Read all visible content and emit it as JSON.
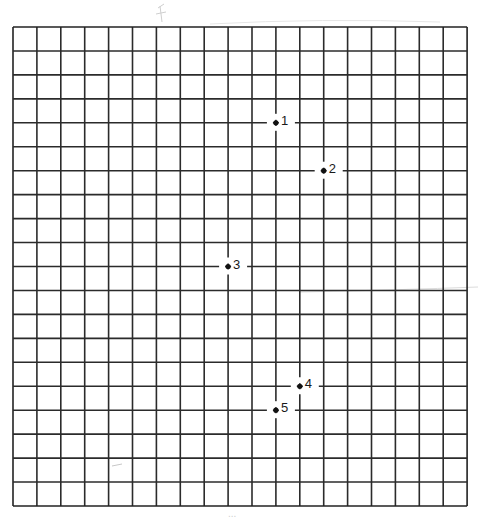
{
  "figure": {
    "type": "grid-with-labeled-points",
    "grid": {
      "origin_px": [
        13,
        27
      ],
      "columns": 19,
      "rows": 20,
      "cell_width_px": 23.9,
      "cell_height_px": 23.95,
      "line_color": "#2b2b2b",
      "border_color": "#222222",
      "background": "#ffffff"
    },
    "points": [
      {
        "label": "1",
        "col": 11,
        "row": 4
      },
      {
        "label": "2",
        "col": 13,
        "row": 6
      },
      {
        "label": "3",
        "col": 9,
        "row": 10
      },
      {
        "label": "4",
        "col": 12,
        "row": 15
      },
      {
        "label": "5",
        "col": 11,
        "row": 16
      }
    ],
    "point_color": "#111111",
    "footer_text": "...",
    "faint_marks_color": "#cfcfcf"
  }
}
